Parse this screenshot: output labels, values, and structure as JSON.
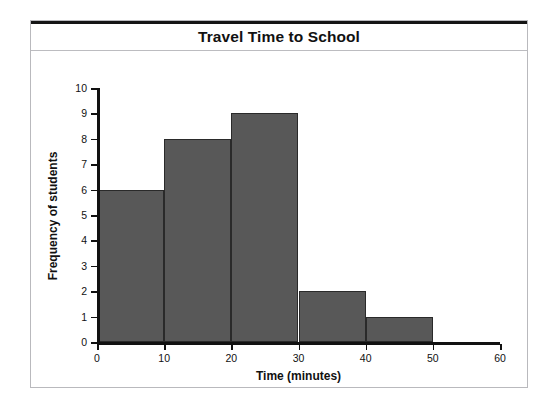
{
  "figure": {
    "background_color": "#ffffff",
    "frame_color": "#b9b9bd",
    "top_rule_color": "#151515"
  },
  "title": "Travel Time to School",
  "chart_data": {
    "type": "bar",
    "title": "Travel Time to School",
    "xlabel": "Time (minutes)",
    "ylabel": "Frequency of students",
    "grid": false,
    "legend": null,
    "bar_color": "#585858",
    "bar_edge_color": "#2a2a2a",
    "xlim": [
      0,
      60
    ],
    "ylim": [
      0,
      10
    ],
    "xticks": [
      0,
      10,
      20,
      30,
      40,
      50,
      60
    ],
    "yticks": [
      0,
      1,
      2,
      3,
      4,
      5,
      6,
      7,
      8,
      9,
      10
    ],
    "xtick_labels": [
      "0",
      "10",
      "20",
      "30",
      "40",
      "50",
      "60"
    ],
    "ytick_labels": [
      "0",
      "1",
      "2",
      "3",
      "4",
      "5",
      "6",
      "7",
      "8",
      "9",
      "10"
    ],
    "bin_width": 10,
    "categories": [
      "0-10",
      "10-20",
      "20-30",
      "30-40",
      "40-50",
      "50-60"
    ],
    "bins": [
      {
        "start": 0,
        "end": 10,
        "value": 6
      },
      {
        "start": 10,
        "end": 20,
        "value": 8
      },
      {
        "start": 20,
        "end": 30,
        "value": 9
      },
      {
        "start": 30,
        "end": 40,
        "value": 2
      },
      {
        "start": 40,
        "end": 50,
        "value": 1
      },
      {
        "start": 50,
        "end": 60,
        "value": 0
      }
    ],
    "values": [
      6,
      8,
      9,
      2,
      1,
      0
    ]
  }
}
